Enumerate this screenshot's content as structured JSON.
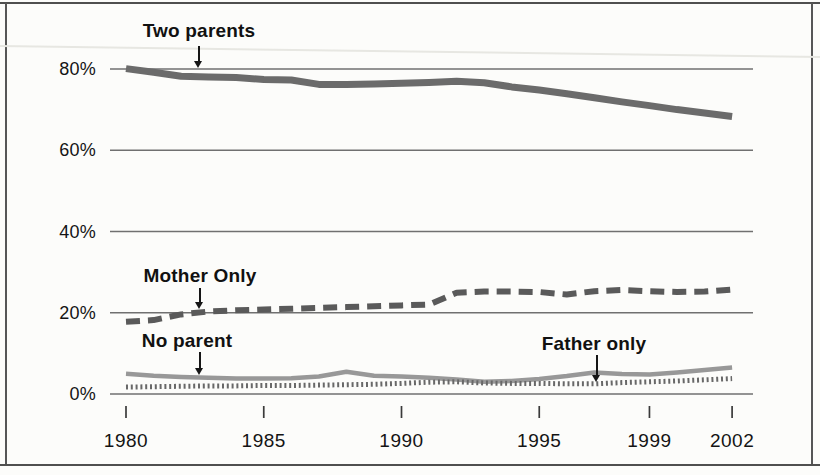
{
  "colors": {
    "paper": "#fcfcfa",
    "grid": "#707070",
    "border": "#4f4f4f",
    "text": "#141414",
    "two_parents_line": "#6b6b6b",
    "mother_only_line": "#5a5a5a",
    "no_parent_line": "#989898",
    "father_only_line": "#686868"
  },
  "chart_data": {
    "type": "line",
    "title": "",
    "xlabel": "",
    "ylabel": "",
    "x": [
      1980,
      1981,
      1982,
      1983,
      1984,
      1985,
      1986,
      1987,
      1988,
      1989,
      1990,
      1991,
      1992,
      1993,
      1994,
      1995,
      1996,
      1997,
      1998,
      1999,
      2000,
      2001,
      2002
    ],
    "series": [
      {
        "name": "Two parents",
        "style": "solid-thick",
        "color": "#6b6b6b",
        "values": [
          80.1,
          79.2,
          78.2,
          78.0,
          77.9,
          77.4,
          77.3,
          76.2,
          76.2,
          76.3,
          76.5,
          76.7,
          77.0,
          76.6,
          75.6,
          74.8,
          73.9,
          72.9,
          71.9,
          71.0,
          70.0,
          69.2,
          68.3
        ]
      },
      {
        "name": "Mother Only",
        "style": "dashed",
        "color": "#5a5a5a",
        "values": [
          17.8,
          18.2,
          19.6,
          20.3,
          20.6,
          20.8,
          21.0,
          21.2,
          21.4,
          21.6,
          21.8,
          22.0,
          24.9,
          25.2,
          25.2,
          25.1,
          24.5,
          25.3,
          25.6,
          25.3,
          25.1,
          25.2,
          25.7
        ]
      },
      {
        "name": "No parent",
        "style": "solid",
        "color": "#989898",
        "values": [
          5.0,
          4.5,
          4.2,
          4.0,
          3.8,
          3.8,
          3.9,
          4.3,
          5.5,
          4.5,
          4.3,
          4.0,
          3.6,
          3.0,
          3.2,
          3.7,
          4.4,
          5.3,
          4.9,
          4.8,
          5.3,
          5.9,
          6.5
        ]
      },
      {
        "name": "Father only",
        "style": "dotted",
        "color": "#686868",
        "values": [
          1.7,
          1.8,
          1.9,
          2.0,
          2.0,
          2.1,
          2.1,
          2.2,
          2.3,
          2.4,
          2.6,
          2.9,
          3.0,
          2.7,
          2.6,
          2.6,
          2.5,
          2.5,
          2.8,
          3.0,
          3.2,
          3.5,
          3.8
        ]
      }
    ],
    "xticks": {
      "values": [
        1980,
        1985,
        1990,
        1995,
        1999,
        2002
      ],
      "labels": [
        "1980",
        "1985",
        "1990",
        "1995",
        "1999",
        "2002"
      ]
    },
    "yticks": {
      "values": [
        0,
        20,
        40,
        60,
        80
      ],
      "labels": [
        "0%",
        "20%",
        "40%",
        "60%",
        "80%"
      ]
    },
    "xlim": [
      1980,
      2002
    ],
    "ylim": [
      0,
      88
    ],
    "grid": "horizontal-only",
    "legend": "inline-annotations",
    "annotations": [
      {
        "text": "Two parents",
        "arrow_points_to": {
          "year": 1983,
          "value": 80
        }
      },
      {
        "text": "Mother Only",
        "arrow_points_to": {
          "year": 1983,
          "value": 20
        }
      },
      {
        "text": "No parent",
        "arrow_points_to": {
          "year": 1983,
          "value": 4
        }
      },
      {
        "text": "Father only",
        "arrow_points_to": {
          "year": 1997,
          "value": 2.5
        }
      }
    ]
  }
}
